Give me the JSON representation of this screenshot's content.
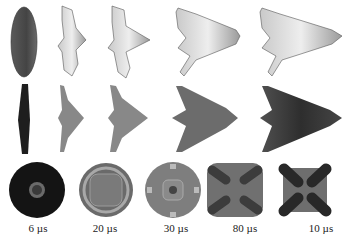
{
  "figure": {
    "rows": [
      "3d-wireframe-view",
      "side-profile-view",
      "top-contour-view"
    ],
    "columns": [
      {
        "time_label": "6 µs"
      },
      {
        "time_label": "20 µs"
      },
      {
        "time_label": "30 µs"
      },
      {
        "time_label": "80 µs"
      },
      {
        "time_label": "10 µs"
      }
    ]
  }
}
